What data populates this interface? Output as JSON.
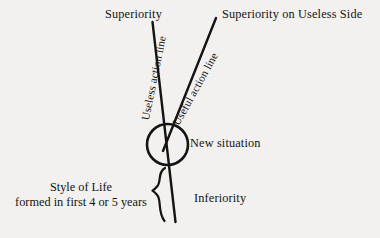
{
  "diagram": {
    "ink_color": "#141414",
    "background_color": "#f2f1ef",
    "labels": {
      "superiority": "Superiority",
      "superiority_useless_side": "Superiority on Useless Side",
      "useless_action_line": "Useless action line",
      "useful_action_line": "Useful action line",
      "new_situation": "New situation",
      "inferiority": "Inferiority",
      "style_of_life_line1": "Style of Life",
      "style_of_life_line2": "formed in first 4 or 5 years"
    },
    "shapes": {
      "circle_name": "new-situation-circle",
      "brace_name": "style-of-life-brace",
      "useless_line_name": "useless-action-line",
      "useful_line_name": "useful-action-line"
    }
  }
}
